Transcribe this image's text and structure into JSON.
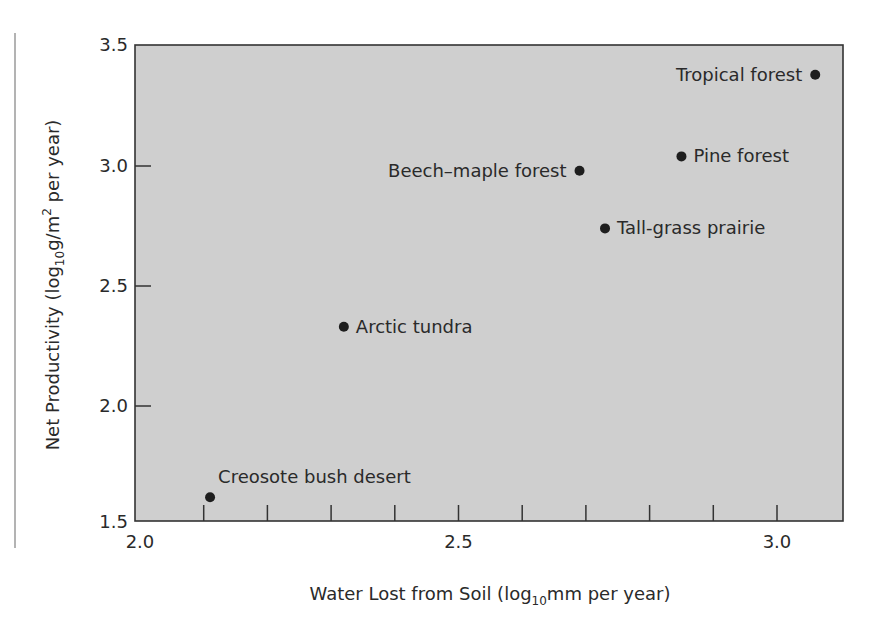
{
  "chart_data": {
    "type": "scatter",
    "title": "",
    "xlabel": "Water Lost from Soil (log10mm per year)",
    "xlabel_parts": {
      "pre": "Water Lost from Soil (log",
      "sub": "10",
      "post": "mm per year)"
    },
    "ylabel": "Net Productivity (log10g/m2 per year)",
    "ylabel_parts": {
      "pre": "Net Productivity (log",
      "sub": "10",
      "mid": "g/m",
      "sup": "2",
      "post": " per year)"
    },
    "xlim": [
      2.0,
      3.1
    ],
    "ylim": [
      1.5,
      3.5
    ],
    "x_ticks": [
      2.0,
      2.1,
      2.2,
      2.3,
      2.4,
      2.5,
      2.6,
      2.7,
      2.8,
      2.9,
      3.0
    ],
    "x_tick_labels": [
      "2.0",
      "2.5",
      "3.0"
    ],
    "y_ticks": [
      1.5,
      2.0,
      2.5,
      3.0,
      3.5
    ],
    "y_tick_labels": [
      "1.5",
      "2.0",
      "2.5",
      "3.0",
      "3.5"
    ],
    "grid": false,
    "legend": null,
    "points": [
      {
        "label": "Creosote bush desert",
        "x": 2.11,
        "y": 1.62,
        "label_pos": "above-right"
      },
      {
        "label": "Arctic tundra",
        "x": 2.32,
        "y": 2.33,
        "label_pos": "right"
      },
      {
        "label": "Beech–maple forest",
        "x": 2.69,
        "y": 2.98,
        "label_pos": "left"
      },
      {
        "label": "Tall-grass prairie",
        "x": 2.73,
        "y": 2.74,
        "label_pos": "right"
      },
      {
        "label": "Pine forest",
        "x": 2.85,
        "y": 3.04,
        "label_pos": "right"
      },
      {
        "label": "Tropical forest",
        "x": 3.06,
        "y": 3.38,
        "label_pos": "left"
      }
    ]
  },
  "colors": {
    "plot_background": "#cfcfcf",
    "axis": "#333333",
    "point": "#1e1e1e",
    "text": "#2a2a2a",
    "margin_rule": "#9a9a9a"
  }
}
